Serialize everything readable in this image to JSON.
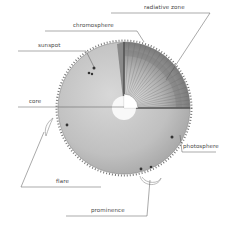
{
  "diagram": {
    "labels": {
      "radiative_zone": "radiative zone",
      "chromosphere": "chromosphere",
      "sunspot": "sunspot",
      "core": "core",
      "photosphere": "photosphere",
      "flare": "flare",
      "prominence": "prominence"
    },
    "colors": {
      "sphere_fill": "#c8c8c8",
      "cutaway_fill": "#9a9a9a",
      "core_fill": "#ffffff",
      "leader_line": "#555555",
      "background": "#ffffff"
    }
  }
}
